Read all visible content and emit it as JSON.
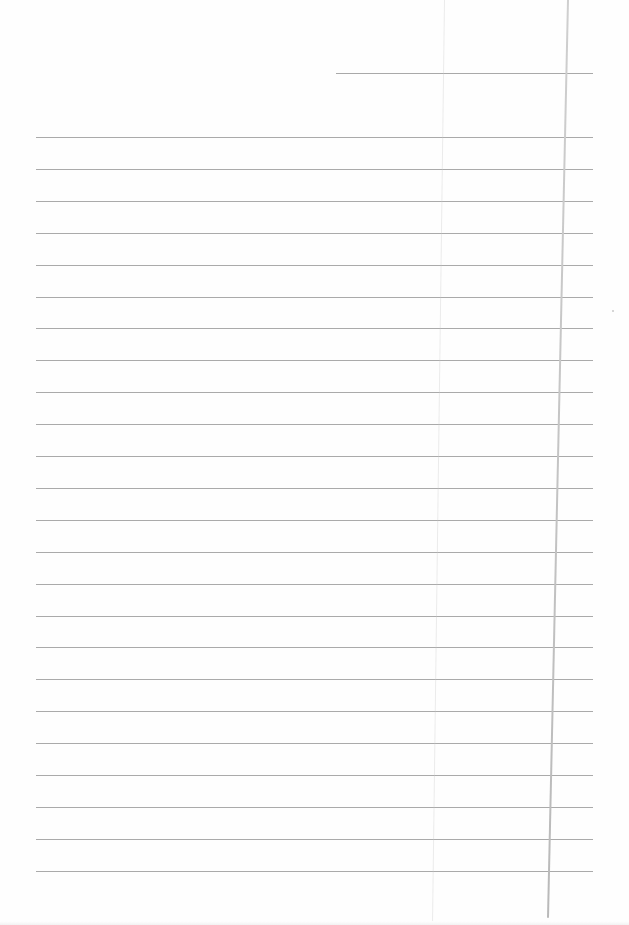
{
  "page": {
    "type": "lined-notebook-paper",
    "background_color": "#fefefe",
    "line_color": "#aaaaaa",
    "margin_line_color": "#c4c4c4"
  },
  "header_line": {
    "x_start": 336,
    "x_end": 593,
    "y": 73
  },
  "rules": {
    "count": 24,
    "x_start": 36,
    "x_end": 593,
    "first_y": 137,
    "spacing": 31.9
  },
  "margin_line": {
    "x_top": 567,
    "x_bottom": 547,
    "y_top": 0,
    "y_bottom": 918
  },
  "crease": {
    "x_top": 444,
    "x_bottom": 432
  },
  "text_content": []
}
